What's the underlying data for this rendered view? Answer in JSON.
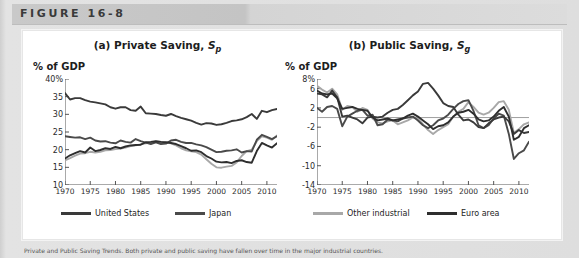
{
  "figure": {
    "header_label": "FIGURE 16-8",
    "caption": "Private and Public Saving Trends. Both private and public saving have fallen over time in the major industrial countries."
  },
  "legend": {
    "left": [
      {
        "label": "United States",
        "color": "#3a3a3a",
        "name": "legend-united-states"
      },
      {
        "label": "Japan",
        "color": "#4a4a4a",
        "name": "legend-japan"
      }
    ],
    "right": [
      {
        "label": "Other industrial",
        "color": "#a8a8a8",
        "name": "legend-other-industrial"
      },
      {
        "label": "Euro area",
        "color": "#2e2e2e",
        "name": "legend-euro-area"
      }
    ]
  },
  "chart_data": [
    {
      "id": "private-saving",
      "type": "line",
      "title_prefix": "(a) Private Saving, ",
      "title_symbol": "S",
      "title_sub": "p",
      "ylabel": "% of GDP",
      "xlabel": "",
      "ylim": [
        10,
        40
      ],
      "yticks": [
        10,
        15,
        20,
        25,
        30,
        35,
        40
      ],
      "ytick_labels": [
        "10",
        "15",
        "20",
        "25",
        "30",
        "35",
        "40%"
      ],
      "xlim": [
        1970,
        2012
      ],
      "xticks": [
        1970,
        1975,
        1980,
        1985,
        1990,
        1995,
        2000,
        2005,
        2010
      ],
      "xtick_labels": [
        "1970",
        "1975",
        "1980",
        "1985",
        "1990",
        "1995",
        "2000",
        "2005",
        "2010"
      ],
      "grid": false,
      "legend_position": "below",
      "x": [
        1970,
        1971,
        1972,
        1973,
        1974,
        1975,
        1976,
        1977,
        1978,
        1979,
        1980,
        1981,
        1982,
        1983,
        1984,
        1985,
        1986,
        1987,
        1988,
        1989,
        1990,
        1991,
        1992,
        1993,
        1994,
        1995,
        1996,
        1997,
        1998,
        1999,
        2000,
        2001,
        2002,
        2003,
        2004,
        2005,
        2006,
        2007,
        2008,
        2009,
        2010,
        2011,
        2012
      ],
      "series": [
        {
          "name": "Japan",
          "color": "#3a3a3a",
          "values": [
            36.0,
            34.2,
            34.6,
            34.6,
            34.0,
            33.6,
            33.4,
            33.1,
            32.8,
            32.0,
            31.6,
            32.0,
            32.0,
            31.2,
            31.0,
            32.2,
            30.3,
            30.2,
            30.1,
            29.8,
            29.6,
            30.1,
            29.5,
            29.0,
            28.6,
            28.2,
            27.6,
            27.1,
            27.5,
            27.4,
            27.0,
            27.2,
            27.6,
            28.1,
            28.3,
            28.6,
            29.2,
            30.1,
            28.7,
            31.0,
            30.6,
            31.2,
            31.5
          ]
        },
        {
          "name": "United States",
          "color": "#4a4a4a",
          "values": [
            23.8,
            23.6,
            23.4,
            23.5,
            23.0,
            23.4,
            22.6,
            22.3,
            22.4,
            22.0,
            21.8,
            22.6,
            22.2,
            22.0,
            23.0,
            22.4,
            22.0,
            21.6,
            22.1,
            21.6,
            21.7,
            22.6,
            22.8,
            22.2,
            21.9,
            21.9,
            21.5,
            21.2,
            20.7,
            20.0,
            19.3,
            19.4,
            19.7,
            19.8,
            20.1,
            19.2,
            19.6,
            19.5,
            22.8,
            24.2,
            23.6,
            23.0,
            23.8
          ]
        },
        {
          "name": "Euro area",
          "color": "#2e2e2e",
          "values": [
            17.5,
            18.4,
            19.0,
            19.6,
            19.2,
            20.6,
            19.6,
            19.9,
            20.4,
            20.2,
            20.8,
            20.4,
            20.9,
            21.2,
            21.3,
            21.4,
            22.1,
            22.2,
            22.4,
            22.2,
            22.1,
            21.9,
            21.6,
            21.0,
            20.4,
            19.7,
            19.8,
            19.3,
            18.2,
            17.5,
            16.6,
            16.4,
            16.5,
            16.2,
            16.8,
            17.0,
            16.5,
            16.3,
            19.6,
            21.9,
            21.2,
            20.6,
            21.8
          ]
        },
        {
          "name": "Other industrial",
          "color": "#a8a8a8",
          "values": [
            17.0,
            17.6,
            18.3,
            18.9,
            19.0,
            19.4,
            19.2,
            19.4,
            19.8,
            19.9,
            20.2,
            20.3,
            20.6,
            21.0,
            21.2,
            21.5,
            21.8,
            22.0,
            22.3,
            22.2,
            22.0,
            21.8,
            21.2,
            20.4,
            19.8,
            19.5,
            19.3,
            18.6,
            17.3,
            16.0,
            15.0,
            14.9,
            15.2,
            15.4,
            16.4,
            18.2,
            19.6,
            20.0,
            22.4,
            23.8,
            23.4,
            22.8,
            24.0
          ]
        }
      ]
    },
    {
      "id": "public-saving",
      "type": "line",
      "title_prefix": "(b) Public Saving, ",
      "title_symbol": "S",
      "title_sub": "g",
      "ylabel": "% of GDP",
      "xlabel": "",
      "ylim": [
        -14,
        8
      ],
      "yticks": [
        -14,
        -10,
        -6,
        -2,
        2,
        6,
        8
      ],
      "ytick_labels": [
        "-14",
        "-10",
        "-6",
        "-2",
        "2",
        "6",
        "8%"
      ],
      "xlim": [
        1970,
        2012
      ],
      "xticks": [
        1970,
        1975,
        1980,
        1985,
        1990,
        1995,
        2000,
        2005,
        2010
      ],
      "xtick_labels": [
        "1970",
        "1975",
        "1980",
        "1985",
        "1990",
        "1995",
        "2000",
        "2005",
        "2010"
      ],
      "zero_line": 0,
      "grid": false,
      "legend_position": "below",
      "x": [
        1970,
        1971,
        1972,
        1973,
        1974,
        1975,
        1976,
        1977,
        1978,
        1979,
        1980,
        1981,
        1982,
        1983,
        1984,
        1985,
        1986,
        1987,
        1988,
        1989,
        1990,
        1991,
        1992,
        1993,
        1994,
        1995,
        1996,
        1997,
        1998,
        1999,
        2000,
        2001,
        2002,
        2003,
        2004,
        2005,
        2006,
        2007,
        2008,
        2009,
        2010,
        2011,
        2012
      ],
      "series": [
        {
          "name": "Japan",
          "color": "#3a3a3a",
          "values": [
            5.0,
            4.8,
            4.2,
            5.6,
            4.2,
            0.2,
            0.4,
            0.0,
            -0.4,
            -1.2,
            0.0,
            0.2,
            0.0,
            0.2,
            1.0,
            1.6,
            1.8,
            2.6,
            3.6,
            4.6,
            5.4,
            7.0,
            7.2,
            6.0,
            4.6,
            3.0,
            2.4,
            2.2,
            0.6,
            -0.6,
            -0.4,
            -1.0,
            -2.0,
            -2.2,
            -1.2,
            -0.4,
            0.0,
            0.2,
            -0.8,
            -3.4,
            -2.6,
            -3.2,
            -3.0
          ]
        },
        {
          "name": "United States",
          "color": "#4a4a4a",
          "values": [
            2.0,
            1.2,
            2.2,
            2.4,
            1.8,
            -1.8,
            0.2,
            0.8,
            1.4,
            1.6,
            0.4,
            0.6,
            -1.6,
            -1.4,
            -0.4,
            -0.6,
            -0.8,
            -0.2,
            0.0,
            0.2,
            -0.6,
            -1.6,
            -2.2,
            -1.6,
            -0.6,
            -0.2,
            0.6,
            1.8,
            2.8,
            3.4,
            3.6,
            1.4,
            -1.6,
            -2.2,
            -1.6,
            -0.2,
            0.8,
            0.4,
            -3.4,
            -8.6,
            -7.4,
            -6.8,
            -5.0
          ]
        },
        {
          "name": "Euro area",
          "color": "#2e2e2e",
          "values": [
            5.6,
            5.0,
            4.8,
            5.0,
            4.0,
            1.8,
            2.0,
            2.2,
            1.8,
            1.6,
            1.4,
            0.0,
            -0.6,
            -0.4,
            -0.2,
            -0.6,
            -0.4,
            -0.2,
            0.4,
            0.8,
            0.2,
            -0.6,
            -1.4,
            -2.4,
            -1.8,
            -1.6,
            -1.0,
            0.2,
            1.0,
            1.2,
            1.6,
            0.8,
            -0.4,
            -0.8,
            -0.6,
            0.2,
            1.4,
            2.2,
            0.2,
            -4.6,
            -4.0,
            -2.2,
            -1.6
          ]
        },
        {
          "name": "Other industrial",
          "color": "#a8a8a8",
          "values": [
            6.6,
            5.8,
            5.2,
            6.0,
            4.8,
            1.6,
            2.4,
            2.2,
            1.2,
            2.0,
            1.6,
            -0.2,
            -1.0,
            -1.2,
            -0.8,
            -0.6,
            -1.4,
            -1.0,
            -0.6,
            0.0,
            -0.2,
            -1.4,
            -2.6,
            -3.4,
            -2.6,
            -2.0,
            -1.4,
            0.2,
            1.2,
            1.8,
            3.2,
            2.2,
            1.0,
            0.6,
            1.0,
            2.0,
            3.2,
            3.4,
            1.6,
            -3.2,
            -2.4,
            -1.4,
            -1.0
          ]
        }
      ]
    }
  ]
}
